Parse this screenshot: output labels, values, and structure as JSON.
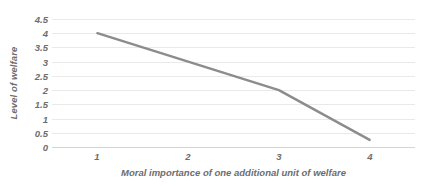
{
  "chart_data": {
    "type": "line",
    "title": "",
    "subtitle": "",
    "xlabel": "Moral importance of one additional unit of welfare",
    "ylabel": "Level of welfare",
    "x": [
      1,
      3,
      4
    ],
    "values": [
      4,
      2,
      0.25
    ],
    "series": [
      {
        "name": "Level of welfare",
        "x": [
          1,
          3,
          4
        ],
        "values": [
          4,
          2,
          0.25
        ],
        "color": "#8c8c8c"
      }
    ],
    "xlim": [
      0.5,
      4.5
    ],
    "ylim": [
      0,
      4.5
    ],
    "x_tick_labels": [
      "1",
      "2",
      "3",
      "4"
    ],
    "x_tick_values": [
      1,
      2,
      3,
      4
    ],
    "y_tick_labels": [
      "4.5",
      "4",
      "3.5",
      "3",
      "2.5",
      "2",
      "1.5",
      "1",
      "0.5",
      "0"
    ],
    "y_tick_values": [
      4.5,
      4,
      3.5,
      3,
      2.5,
      2,
      1.5,
      1,
      0.5,
      0
    ],
    "grid": "horizontal",
    "legend": "none",
    "annotations": [],
    "colors": {
      "line": "#8c8c8c",
      "gridline": "#e9e9e9",
      "axis": "#d4d4d4",
      "text": "#6d6d6d",
      "background": "#ffffff"
    }
  }
}
